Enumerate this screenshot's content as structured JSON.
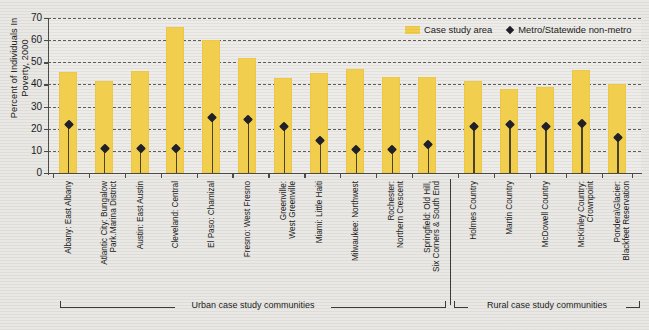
{
  "chart_data": {
    "type": "bar",
    "title": "",
    "xlabel": "",
    "ylabel": "Percent of Individuals\nIn Poverty, 2000",
    "ylim": [
      0,
      70
    ],
    "yticks": [
      0,
      10,
      20,
      30,
      40,
      50,
      60,
      70
    ],
    "grid": true,
    "legend_position": "top-right",
    "categories": [
      "Albany: East Albany",
      "Atlantic City: Bungalow\nPark.Marina District",
      "Austin: East Austin",
      "Cleveland: Central",
      "El Paso: Chamizal",
      "Fresno: West Fresno",
      "Greenville:\nWest Greenville",
      "Miami: Little Haiti",
      "Milwaukee: Northwest",
      "Rochester:\nNorthern Crescent",
      "Springfield: Old Hill,\nSix Corners & South End",
      "Holmes Country",
      "Martin Country",
      "McDowell Country",
      "McKinley Country:\nCrownpoint",
      "Pondera\\Glacier:\nBlackfeet Reservation"
    ],
    "series": [
      {
        "name": "Case study area",
        "type": "bar",
        "color": "#f2ce4f",
        "values": [
          45.5,
          41.5,
          46,
          66,
          60,
          52,
          43,
          45,
          47,
          43.5,
          43.5,
          41.5,
          38,
          39,
          46.5,
          40
        ]
      },
      {
        "name": "Metro/Statewide non-metro",
        "type": "marker",
        "color": "#20202a",
        "values": [
          22,
          11,
          11,
          11,
          25,
          24,
          21,
          14.5,
          10.5,
          10.5,
          13,
          21,
          22,
          21,
          22.5,
          16
        ]
      }
    ],
    "groups": [
      {
        "label": "Urban case study communities",
        "start": 0,
        "end": 10
      },
      {
        "label": "Rural case study communities",
        "start": 11,
        "end": 15
      }
    ]
  },
  "legend": {
    "items": [
      {
        "label": "Case study area",
        "marker": "bar-swatch-icon"
      },
      {
        "label": "Metro/Statewide non-metro",
        "marker": "diamond-marker-icon"
      }
    ]
  },
  "axis": {
    "y_title": "Percent of Individuals\nIn Poverty, 2000",
    "y_tick_labels": [
      "0",
      "10",
      "20",
      "30",
      "40",
      "50",
      "60",
      "70"
    ]
  }
}
